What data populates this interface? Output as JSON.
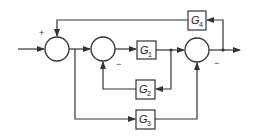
{
  "diagram": {
    "type": "control-system-block-diagram",
    "blocks": [
      {
        "id": "G1",
        "label": "G",
        "subscript": "1"
      },
      {
        "id": "G2",
        "label": "G",
        "subscript": "2"
      },
      {
        "id": "G3",
        "label": "G",
        "subscript": "3"
      },
      {
        "id": "G4",
        "label": "G",
        "subscript": "4"
      }
    ],
    "summing_junctions": [
      {
        "id": "S1",
        "signs": {
          "left": "",
          "top": "+"
        }
      },
      {
        "id": "S2",
        "signs": {
          "left": "",
          "bottom": "−"
        }
      },
      {
        "id": "S3",
        "signs": {
          "left": "",
          "bottom": "−"
        }
      }
    ],
    "signs": {
      "s1_top": "+",
      "s2_bottom": "−",
      "s3_bottom": "−"
    },
    "connections": [
      "input -> S1",
      "S1 -> S2",
      "S1 -> G3",
      "S2 -> G1",
      "G1 -> S3",
      "G1 -> G2",
      "G2 -> S2 (negative)",
      "G3 -> S3 (negative)",
      "S3 -> output",
      "output -> G4",
      "G4 -> S1 (positive)"
    ],
    "colors": {
      "stroke": "#333333",
      "background": "#ffffff"
    }
  }
}
